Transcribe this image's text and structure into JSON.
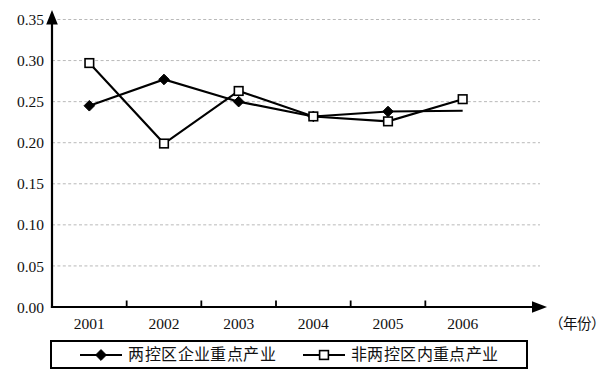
{
  "chart_data": {
    "type": "line",
    "title": "",
    "subtitle": "",
    "xlabel": "（年份）",
    "ylabel": "",
    "categories": [
      "2001",
      "2002",
      "2003",
      "2004",
      "2005",
      "2006"
    ],
    "ylim": [
      0.0,
      0.35
    ],
    "ytick_labels": [
      "0.00",
      "0.05",
      "0.10",
      "0.15",
      "0.20",
      "0.25",
      "0.30",
      "0.35"
    ],
    "ytick_values": [
      0.0,
      0.05,
      0.1,
      0.15,
      0.2,
      0.25,
      0.3,
      0.35
    ],
    "grid": "horizontal-dashed",
    "legend_position": "bottom",
    "series": [
      {
        "name": "两控区企业重点产业",
        "marker": "filled-diamond",
        "values": [
          0.245,
          0.277,
          0.25,
          0.232,
          0.238,
          0.239
        ]
      },
      {
        "name": "非两控区内重点产业",
        "marker": "open-square",
        "values": [
          0.297,
          0.199,
          0.263,
          0.232,
          0.226,
          0.253
        ]
      }
    ]
  },
  "axes": {
    "x_caption": "（年份）"
  },
  "legend": {
    "entries": [
      {
        "label": "两控区企业重点产业",
        "marker": "filled-diamond"
      },
      {
        "label": "非两控区内重点产业",
        "marker": "open-square"
      }
    ]
  }
}
